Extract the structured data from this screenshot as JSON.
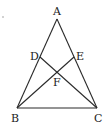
{
  "diagram": {
    "type": "triangle-with-cevians",
    "points": {
      "A": {
        "label": "A",
        "x": 57,
        "y": 19
      },
      "B": {
        "label": "B",
        "x": 17,
        "y": 108
      },
      "C": {
        "label": "C",
        "x": 97,
        "y": 108
      },
      "D": {
        "label": "D",
        "x": 40,
        "y": 57
      },
      "E": {
        "label": "E",
        "x": 74,
        "y": 57
      },
      "F": {
        "label": "F",
        "x": 57,
        "y": 71
      }
    },
    "segments": [
      "AB",
      "AC",
      "BC",
      "BE",
      "CD"
    ],
    "labels": {
      "A": "A",
      "B": "B",
      "C": "C",
      "D": "D",
      "E": "E",
      "F": "F"
    }
  }
}
